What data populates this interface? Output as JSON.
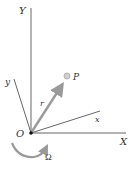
{
  "diagram": {
    "labels": {
      "Y_axis": "Y",
      "X_axis": "X",
      "y_axis": "y",
      "x_axis": "x",
      "origin": "O",
      "point": "P",
      "vector": "r",
      "angular_velocity": "Ω"
    },
    "colors": {
      "axis_line": "#555555",
      "vector": "#9a9a9a",
      "point_fill": "#c8c8c8",
      "text": "#333333"
    }
  }
}
